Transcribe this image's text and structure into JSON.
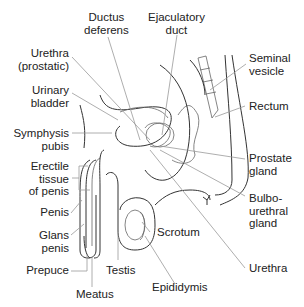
{
  "diagram": {
    "labels": {
      "ductus_deferens": "Ductus\ndeferens",
      "ejaculatory_duct": "Ejaculatory\nduct",
      "urethra_prostatic": "Urethra\n(prostatic)",
      "seminal_vesicle": "Seminal\nvesicle",
      "urinary_bladder": "Urinary\nbladder",
      "rectum": "Rectum",
      "symphysis_pubis": "Symphysis\npubis",
      "prostate_gland": "Prostate\ngland",
      "erectile_tissue": "Erectile\ntissue\nof penis",
      "bulbourethral_gland": "Bulbo-\nurethral\ngland",
      "penis": "Penis",
      "glans_penis": "Glans\npenis",
      "scrotum": "Scrotum",
      "prepuce": "Prepuce",
      "testis": "Testis",
      "urethra": "Urethra",
      "meatus": "Meatus",
      "epididymis": "Epididymis"
    }
  }
}
